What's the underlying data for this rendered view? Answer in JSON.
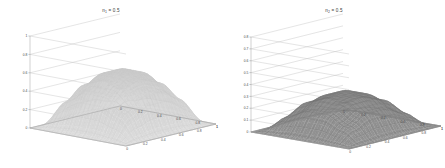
{
  "figure": {
    "background": "#ffffff",
    "panel_count": 2
  },
  "chart_data": [
    {
      "type": "surface",
      "id": "left-surface-plot",
      "title": "n1 = 0.5",
      "title_base": "n",
      "title_sub": "1",
      "title_rest": " = 0.5",
      "xlabel": "",
      "ylabel": "",
      "zlabel": "",
      "grid": true,
      "legend": "none",
      "surface_color": "#dcdcdc",
      "mesh_color": "#c9c9c9",
      "xlim": [
        0,
        1
      ],
      "ylim": [
        0,
        1
      ],
      "zlim": [
        0,
        1
      ],
      "xticks": [
        0,
        0.2,
        0.4,
        0.6,
        0.8,
        1
      ],
      "xticklabels": [
        "0",
        "0.2",
        "0.4",
        "0.6",
        "0.8",
        "1"
      ],
      "yticks": [
        0,
        0.2,
        0.4,
        0.6,
        0.8,
        1
      ],
      "yticklabels": [
        "0",
        "0.2",
        "0.4",
        "0.6",
        "0.8",
        "1"
      ],
      "zticks": [
        0,
        0.2,
        0.4,
        0.6,
        0.8,
        1
      ],
      "zticklabels": [
        "0",
        "0.2",
        "0.4",
        "0.6",
        "0.8",
        "1"
      ],
      "shape": "dome",
      "z_peak": 0.62,
      "z_min": 0.0,
      "description": "Smooth dome-shaped mesh surface rising from zero at all four corners to a broad plateau near z = 0.6 in the interior",
      "z_grid": [
        [
          0.0,
          0.0,
          0.0,
          0.0,
          0.0,
          0.0
        ],
        [
          0.0,
          0.28,
          0.42,
          0.42,
          0.28,
          0.0
        ],
        [
          0.0,
          0.42,
          0.58,
          0.58,
          0.42,
          0.0
        ],
        [
          0.0,
          0.42,
          0.58,
          0.58,
          0.42,
          0.0
        ],
        [
          0.0,
          0.28,
          0.42,
          0.42,
          0.28,
          0.0
        ],
        [
          0.0,
          0.0,
          0.0,
          0.0,
          0.0,
          0.0
        ]
      ]
    },
    {
      "type": "surface",
      "id": "right-surface-plot",
      "title": "n2 = 0.5",
      "title_base": "n",
      "title_sub": "2",
      "title_rest": " = 0.5",
      "xlabel": "",
      "ylabel": "",
      "zlabel": "",
      "grid": true,
      "legend": "none",
      "surface_color": "#949494",
      "mesh_color": "#6f6f6f",
      "xlim": [
        0,
        1
      ],
      "ylim": [
        0,
        1
      ],
      "zlim": [
        0,
        0.8
      ],
      "xticks": [
        0,
        0.2,
        0.4,
        0.6,
        0.8,
        1
      ],
      "xticklabels": [
        "0",
        "0.2",
        "0.4",
        "0.6",
        "0.8",
        "1"
      ],
      "yticks": [
        0,
        0.2,
        0.4,
        0.6,
        0.8,
        1
      ],
      "yticklabels": [
        "0",
        "0.2",
        "0.4",
        "0.6",
        "0.8",
        "1"
      ],
      "zticks": [
        0,
        0.1,
        0.2,
        0.3,
        0.4,
        0.5,
        0.6,
        0.7,
        0.8
      ],
      "zticklabels": [
        "0",
        "0.1",
        "0.2",
        "0.3",
        "0.4",
        "0.5",
        "0.6",
        "0.7",
        "0.8"
      ],
      "shape": "ridge",
      "z_peak": 0.3,
      "z_min": 0.0,
      "description": "Low dark-gray ridge/saddle surface, flat near zero at the front corner and rising to a narrow crest around z = 0.3 toward the back",
      "z_grid": [
        [
          0.0,
          0.0,
          0.0,
          0.0,
          0.0,
          0.0
        ],
        [
          0.0,
          0.12,
          0.2,
          0.2,
          0.12,
          0.0
        ],
        [
          0.0,
          0.2,
          0.29,
          0.29,
          0.2,
          0.0
        ],
        [
          0.0,
          0.2,
          0.29,
          0.29,
          0.2,
          0.0
        ],
        [
          0.0,
          0.12,
          0.2,
          0.2,
          0.12,
          0.0
        ],
        [
          0.0,
          0.0,
          0.0,
          0.0,
          0.0,
          0.0
        ]
      ]
    }
  ]
}
